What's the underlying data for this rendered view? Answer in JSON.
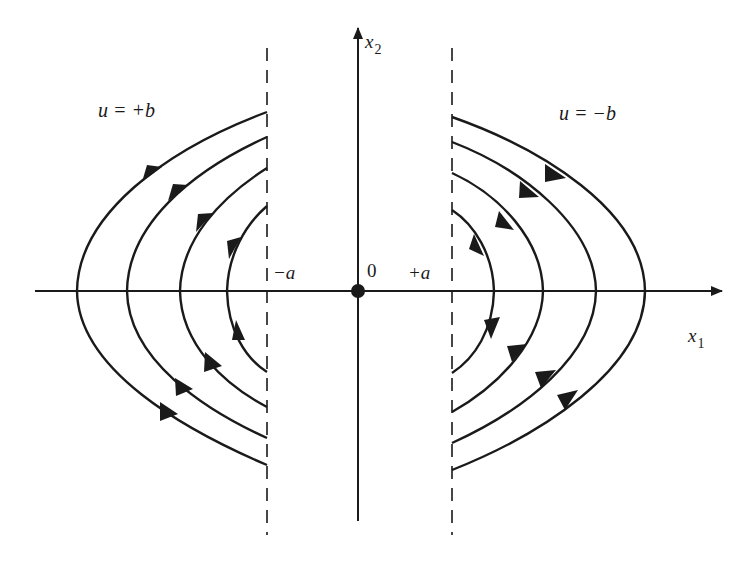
{
  "figure": {
    "type": "phase-plane",
    "colors": {
      "ink": "#1a1a1a",
      "background": "#ffffff"
    }
  },
  "axes": {
    "x_label": "x",
    "x_subscript": "1",
    "y_label": "x",
    "y_subscript": "2",
    "origin_label": "0"
  },
  "boundaries": {
    "left_label": "−a",
    "right_label": "+a",
    "style": "dashed"
  },
  "regions": {
    "left_control_label": "u = +b",
    "right_control_label": "u = −b"
  },
  "trajectories": {
    "left_region": {
      "count": 4,
      "shape": "parabolic arcs opening right",
      "direction": "upward (counter-clockwise, moving up along x2)",
      "x1_axis_crossings_px": [
        77,
        127,
        180,
        227
      ]
    },
    "right_region": {
      "count": 4,
      "shape": "parabolic arcs opening left",
      "direction": "downward (clockwise, moving down along x2)",
      "x1_axis_crossings_px": [
        645,
        596,
        543,
        494
      ]
    }
  },
  "geometry": {
    "origin_px": [
      358,
      291
    ],
    "left_boundary_x_px": 267,
    "right_boundary_x_px": 452
  }
}
